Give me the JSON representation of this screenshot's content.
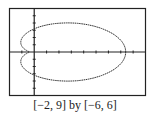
{
  "chart_data": {
    "type": "line",
    "title": "",
    "caption": "[−2, 9] by [−6, 6]",
    "xlim": [
      -2,
      9
    ],
    "ylim": [
      -6,
      6
    ],
    "xlabel": "",
    "ylabel": "",
    "grid": false,
    "xtick_step": 1,
    "ytick_step": 1,
    "series": [
      {
        "name": "polar curve (limaçon-like)",
        "curve": "r = 4 + 4cos(θ) approx, scaled",
        "rightmost_x": 7.4,
        "max_y": 4.1,
        "min_y": -4.1,
        "leftmost_x": -0.8
      }
    ]
  },
  "caption": "[−2, 9] by [−6, 6]"
}
